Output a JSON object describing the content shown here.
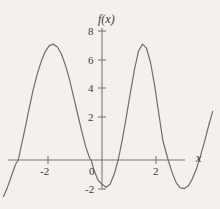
{
  "figure": {
    "background_color": "#f4f1ec",
    "curve_color": "#6e6e6e",
    "axis_color": "#7a7a7a",
    "text_color": "#3b3b3b"
  },
  "labels": {
    "y_axis_title": "f(x)",
    "x_axis_title": "x",
    "y_ticks": [
      "8",
      "6",
      "4",
      "2",
      "0",
      "-2"
    ],
    "x_ticks": [
      "-2",
      "2"
    ]
  },
  "chart_data": {
    "type": "line",
    "title": "",
    "xlabel": "x",
    "ylabel": "f(x)",
    "xlim": [
      -3.7,
      4.2
    ],
    "ylim": [
      -2.6,
      8.8
    ],
    "grid": false,
    "legend": null,
    "x_ticks": [
      -2,
      0,
      2
    ],
    "x_tick_labels": [
      "-2",
      "0",
      "2"
    ],
    "y_ticks": [
      -2,
      0,
      2,
      4,
      6,
      8
    ],
    "y_tick_labels": [
      "-2",
      "0",
      "2",
      "4",
      "6",
      "8"
    ],
    "features": {
      "local_maxima": [
        {
          "x": -1.8,
          "y": 8.1
        },
        {
          "x": 1.35,
          "y": 8.1
        }
      ],
      "local_minima": [
        {
          "x": 0.15,
          "y": -1.9
        },
        {
          "x": 3.05,
          "y": -2.0
        }
      ],
      "x_intercepts": [
        -3.1,
        -0.4,
        0.6,
        2.45
      ],
      "y_intercept": -1.5
    },
    "series": [
      {
        "name": "f(x)",
        "x": [
          -3.65,
          -3.5,
          -3.35,
          -3.2,
          -3.1,
          -3.0,
          -2.85,
          -2.7,
          -2.55,
          -2.4,
          -2.25,
          -2.1,
          -1.95,
          -1.8,
          -1.65,
          -1.5,
          -1.35,
          -1.2,
          -1.05,
          -0.9,
          -0.75,
          -0.6,
          -0.45,
          -0.4,
          -0.3,
          -0.15,
          0.0,
          0.15,
          0.3,
          0.45,
          0.6,
          0.75,
          0.9,
          1.05,
          1.2,
          1.35,
          1.5,
          1.65,
          1.8,
          1.95,
          2.1,
          2.25,
          2.45,
          2.6,
          2.75,
          2.9,
          3.05,
          3.2,
          3.35,
          3.5,
          3.65,
          3.8,
          3.95,
          4.1
        ],
        "y": [
          -2.55,
          -1.9,
          -1.1,
          -0.3,
          0.0,
          0.9,
          2.2,
          3.6,
          4.9,
          6.0,
          6.9,
          7.6,
          8.0,
          8.1,
          7.9,
          7.4,
          6.6,
          5.6,
          4.4,
          3.2,
          2.0,
          0.9,
          0.1,
          0.0,
          -0.7,
          -1.4,
          -1.7,
          -1.9,
          -1.7,
          -1.0,
          0.0,
          1.4,
          3.0,
          4.7,
          6.3,
          7.6,
          8.1,
          7.8,
          6.8,
          5.2,
          3.3,
          1.4,
          0.0,
          -0.9,
          -1.6,
          -1.95,
          -2.0,
          -1.8,
          -1.3,
          -0.6,
          0.3,
          1.3,
          2.4,
          3.4
        ]
      }
    ]
  },
  "geometry": {
    "origin_px": {
      "x": 102,
      "y": 160
    },
    "px_per_unit_x": 27.0,
    "px_per_unit_y": 14.3
  }
}
